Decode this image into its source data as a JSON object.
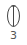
{
  "tool": {
    "icon": "ellipse-with-axis-icon",
    "label": "3",
    "colors": {
      "stroke": "#444444",
      "label": "#555555",
      "background": "#ffffff"
    }
  }
}
